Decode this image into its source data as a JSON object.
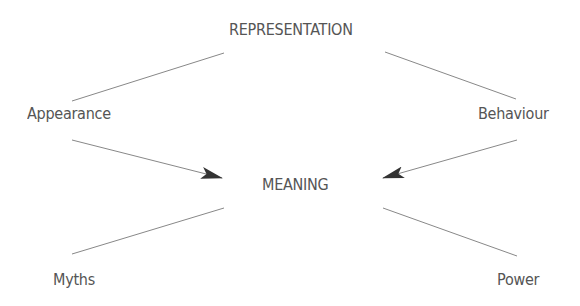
{
  "diagram": {
    "nodes": {
      "representation": "REPRESENTATION",
      "appearance": "Appearance",
      "behaviour": "Behaviour",
      "meaning": "MEANING",
      "myths": "Myths",
      "power": "Power"
    },
    "edges": [
      {
        "from": "appearance",
        "to": "representation",
        "type": "line"
      },
      {
        "from": "behaviour",
        "to": "representation",
        "type": "line"
      },
      {
        "from": "appearance",
        "to": "meaning",
        "type": "arrow"
      },
      {
        "from": "behaviour",
        "to": "meaning",
        "type": "arrow"
      },
      {
        "from": "meaning",
        "to": "myths",
        "type": "line"
      },
      {
        "from": "meaning",
        "to": "power",
        "type": "line"
      }
    ],
    "colors": {
      "text": "#555555",
      "line": "#888888",
      "arrowhead": "#333333"
    }
  }
}
